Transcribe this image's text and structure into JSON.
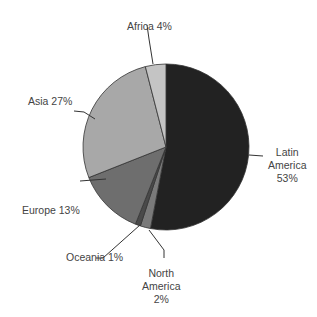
{
  "chart_data": {
    "type": "pie",
    "title": "",
    "start_angle": "12 o'clock",
    "direction": "clockwise",
    "slices": [
      {
        "label": "Latin America",
        "value": 53,
        "color": "#222222"
      },
      {
        "label": "North America",
        "value": 2,
        "color": "#7a7a7a"
      },
      {
        "label": "Oceania",
        "value": 1,
        "color": "#4a4a4a"
      },
      {
        "label": "Europe",
        "value": 13,
        "color": "#6e6e6e"
      },
      {
        "label": "Asia",
        "value": 27,
        "color": "#a8a8a8"
      },
      {
        "label": "Africa",
        "value": 4,
        "color": "#c4c4c4"
      }
    ]
  },
  "labels": {
    "africa": "Africa 4%",
    "asia": "Asia 27%",
    "europe": "Europe 13%",
    "oceania": "Oceania 1%",
    "north_america_1": "North",
    "north_america_2": "America",
    "north_america_3": "2%",
    "latin_america_1": "Latin",
    "latin_america_2": "America",
    "latin_america_3": "53%"
  }
}
